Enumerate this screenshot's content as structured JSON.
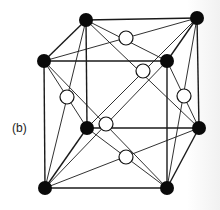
{
  "figure": {
    "label": "(b)",
    "colors": {
      "corner_atom": "#0a0a0a",
      "face_atom": "#ffffff",
      "line": "#1a1a1a"
    },
    "corner_atoms": [
      {
        "name": "front-top-left",
        "x": 44,
        "y": 61
      },
      {
        "name": "front-top-right",
        "x": 167,
        "y": 61
      },
      {
        "name": "front-bottom-left",
        "x": 45,
        "y": 188
      },
      {
        "name": "front-bottom-right",
        "x": 167,
        "y": 188
      },
      {
        "name": "back-top-left",
        "x": 86,
        "y": 20
      },
      {
        "name": "back-top-right",
        "x": 197,
        "y": 18
      },
      {
        "name": "back-bottom-left",
        "x": 87,
        "y": 128
      },
      {
        "name": "back-bottom-right",
        "x": 199,
        "y": 128
      }
    ],
    "face_atoms": [
      {
        "name": "top",
        "x": 126,
        "y": 38
      },
      {
        "name": "back",
        "x": 143,
        "y": 71
      },
      {
        "name": "left",
        "x": 67,
        "y": 97
      },
      {
        "name": "right",
        "x": 184,
        "y": 96
      },
      {
        "name": "front",
        "x": 106,
        "y": 124
      },
      {
        "name": "bottom",
        "x": 126,
        "y": 157
      }
    ]
  }
}
